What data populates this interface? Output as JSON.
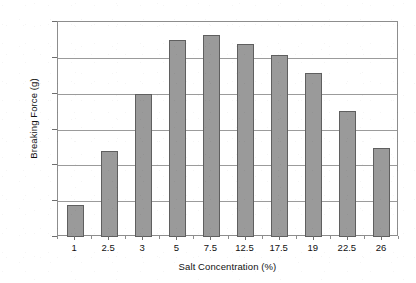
{
  "chart_data": {
    "type": "bar",
    "title": "",
    "xlabel": "Salt Concentration (%)",
    "ylabel": "Breaking Force (g)",
    "categories": [
      "1",
      "2.5",
      "3",
      "5",
      "7.5",
      "12.5",
      "17.5",
      "19",
      "22.5",
      "26"
    ],
    "values": [
      88,
      239,
      400,
      550,
      564,
      538,
      508,
      458,
      353,
      247
    ],
    "ylim": [
      0,
      600
    ],
    "yticks": [
      0,
      100,
      200,
      300,
      400,
      500,
      600
    ],
    "ytick_labels": [
      "0",
      "100",
      "200",
      "300",
      "400",
      "500",
      "600"
    ],
    "grid": "horizontal",
    "legend": "none",
    "series": [
      {
        "name": "Breaking Force",
        "values": [
          88,
          239,
          400,
          550,
          564,
          538,
          508,
          458,
          353,
          247
        ]
      }
    ],
    "colors": {
      "bar_fill": "#9a9a9a",
      "bar_border": "#5f5f5f",
      "gridline": "#9b9b9b",
      "axis": "#8d8d8d",
      "text": "#111111",
      "background": "#ffffff"
    }
  }
}
